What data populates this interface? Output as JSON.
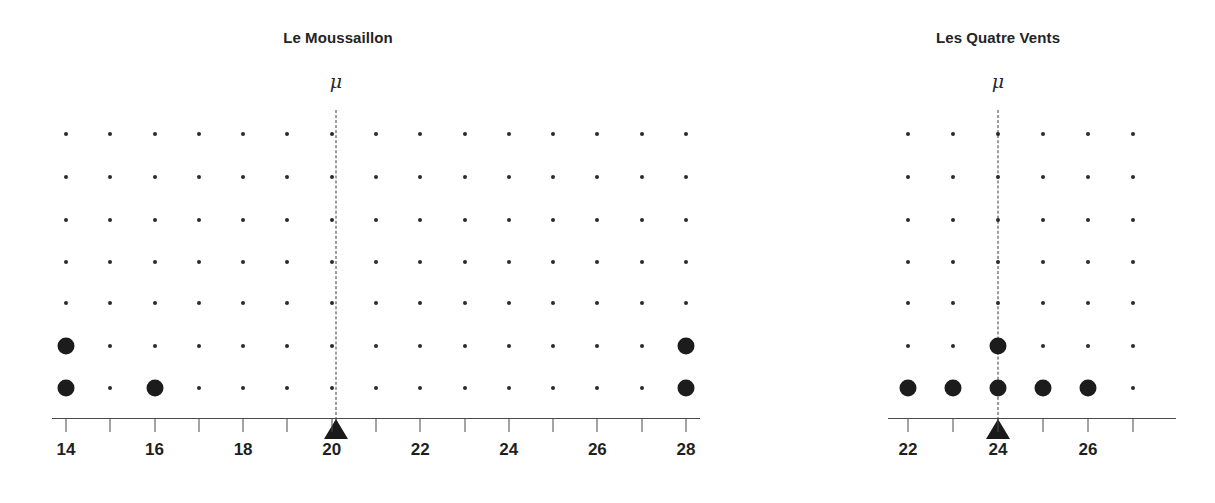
{
  "figure": {
    "background": "#ffffff",
    "ink": "#1a1a1a",
    "width": 1215,
    "height": 503
  },
  "chart_data": {
    "type": "scatter",
    "subtype": "dotplot-grid",
    "title": "",
    "xlabel": "",
    "ylabel": "",
    "grid": true,
    "legend_position": "none",
    "panels": [
      {
        "name": "le-moussaillon",
        "title": "Le Moussaillon",
        "mu_label": "μ",
        "mu_value": 20,
        "xlim": [
          14,
          28
        ],
        "x_ticks": [
          14,
          15,
          16,
          17,
          18,
          19,
          20,
          21,
          22,
          23,
          24,
          25,
          26,
          27,
          28
        ],
        "x_tick_labels": [
          "14",
          "",
          "16",
          "",
          "18",
          "",
          "20",
          "",
          "22",
          "",
          "24",
          "",
          "26",
          "",
          "28"
        ],
        "rows": 7,
        "grid_columns": [
          14,
          15,
          16,
          17,
          18,
          19,
          20,
          21,
          22,
          23,
          24,
          25,
          26,
          27,
          28
        ],
        "data_points": [
          {
            "x": 14,
            "row": 1
          },
          {
            "x": 14,
            "row": 2
          },
          {
            "x": 16,
            "row": 1
          },
          {
            "x": 28,
            "row": 1
          },
          {
            "x": 28,
            "row": 2
          }
        ],
        "counts": {
          "14": 2,
          "16": 1,
          "28": 2
        },
        "values": [
          14,
          14,
          16,
          28,
          28
        ]
      },
      {
        "name": "les-quatre-vents",
        "title": "Les Quatre Vents",
        "mu_label": "μ",
        "mu_value": 24,
        "xlim": [
          22,
          27
        ],
        "x_ticks": [
          22,
          23,
          24,
          25,
          26,
          27
        ],
        "x_tick_labels": [
          "22",
          "",
          "24",
          "",
          "26",
          ""
        ],
        "rows": 7,
        "grid_columns": [
          22,
          23,
          24,
          25,
          26,
          27
        ],
        "data_points": [
          {
            "x": 22,
            "row": 1
          },
          {
            "x": 23,
            "row": 1
          },
          {
            "x": 24,
            "row": 1
          },
          {
            "x": 24,
            "row": 2
          },
          {
            "x": 25,
            "row": 1
          },
          {
            "x": 26,
            "row": 1
          }
        ],
        "counts": {
          "22": 1,
          "23": 1,
          "24": 2,
          "25": 1,
          "26": 1
        },
        "values": [
          22,
          23,
          24,
          24,
          25,
          26
        ]
      }
    ]
  }
}
